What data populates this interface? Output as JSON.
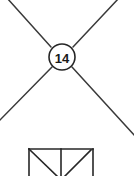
{
  "diagram": {
    "background_color": "#ffffff",
    "line_color": "#3a3a3a",
    "line_color_dark": "#262626",
    "text_color": "#1a1a1a",
    "callout": {
      "label": "14",
      "shape": "circle",
      "center_x": 62,
      "center_y": 57,
      "radius": 13,
      "stroke_width": 1.6,
      "fill": "#ffffff"
    },
    "cross_lines": [
      {
        "name": "upper-left-to-center",
        "x1": 7,
        "y1": -2,
        "x2": 51,
        "y2": 47,
        "stroke_width": 1.5
      },
      {
        "name": "upper-right-to-center",
        "x1": 119,
        "y1": -2,
        "x2": 73,
        "y2": 47,
        "stroke_width": 1.5
      },
      {
        "name": "center-to-lower-left",
        "x1": 52,
        "y1": 67,
        "x2": -2,
        "y2": 122,
        "stroke_width": 1.5
      },
      {
        "name": "center-to-lower-right",
        "x1": 72,
        "y1": 67,
        "x2": 136,
        "y2": 137,
        "stroke_width": 1.5
      }
    ],
    "truss_panel": {
      "name": "lower-truss-panel",
      "left": 29,
      "right": 93,
      "top": 149,
      "bottom": 178,
      "center_divider_x": 61,
      "stroke_width": 1.6,
      "members": [
        {
          "name": "top-chord",
          "x1": 29,
          "y1": 149,
          "x2": 93,
          "y2": 149
        },
        {
          "name": "left-post",
          "x1": 29,
          "y1": 149,
          "x2": 29,
          "y2": 178
        },
        {
          "name": "right-post",
          "x1": 93,
          "y1": 149,
          "x2": 93,
          "y2": 178
        },
        {
          "name": "center-post",
          "x1": 61,
          "y1": 149,
          "x2": 61,
          "y2": 178
        },
        {
          "name": "left-diagonal",
          "x1": 29,
          "y1": 149,
          "x2": 59,
          "y2": 178
        },
        {
          "name": "right-diagonal",
          "x1": 63,
          "y1": 178,
          "x2": 91,
          "y2": 150
        }
      ]
    }
  }
}
